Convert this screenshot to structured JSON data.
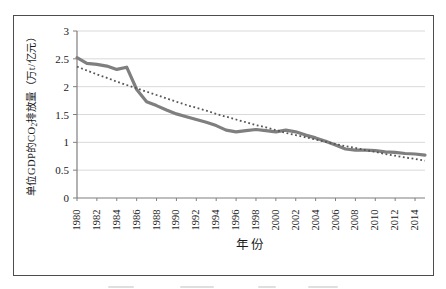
{
  "figure": {
    "ylabel_pre": "单位GDP的CO",
    "ylabel_sub": "2",
    "ylabel_post": "排放量（万t/亿元）",
    "x_axis_title": "年份"
  },
  "chart_data": {
    "type": "line",
    "title": "",
    "xlabel": "年份",
    "ylabel": "单位GDP的CO₂排放量（万t/亿元）",
    "ylim": [
      0,
      3
    ],
    "ytick_step": 0.5,
    "ytick_labels": [
      "3",
      "2.5",
      "2",
      "1.5",
      "1",
      "0.5",
      "0"
    ],
    "grid": "horizontal",
    "legend": "none",
    "x": [
      1980,
      1981,
      1982,
      1983,
      1984,
      1985,
      1986,
      1987,
      1988,
      1989,
      1990,
      1991,
      1992,
      1993,
      1994,
      1995,
      1996,
      1997,
      1998,
      1999,
      2000,
      2001,
      2002,
      2003,
      2004,
      2005,
      2006,
      2007,
      2008,
      2009,
      2010,
      2011,
      2012,
      2013,
      2014,
      2015
    ],
    "xtick_labels": [
      "1980",
      "1982",
      "1984",
      "1986",
      "1988",
      "1990",
      "1992",
      "1994",
      "1996",
      "1998",
      "2000",
      "2002",
      "2004",
      "2006",
      "2008",
      "2010",
      "2012",
      "2014"
    ],
    "series": [
      {
        "name": "solid-line",
        "style": "solid",
        "color": "#7f7f7f",
        "values": [
          2.52,
          2.42,
          2.4,
          2.37,
          2.31,
          2.35,
          1.95,
          1.73,
          1.66,
          1.58,
          1.51,
          1.46,
          1.41,
          1.36,
          1.3,
          1.22,
          1.19,
          1.21,
          1.23,
          1.21,
          1.19,
          1.22,
          1.19,
          1.13,
          1.08,
          1.02,
          0.95,
          0.88,
          0.86,
          0.86,
          0.85,
          0.83,
          0.82,
          0.8,
          0.79,
          0.77
        ]
      },
      {
        "name": "dotted-trendline",
        "style": "dotted",
        "color": "#565656",
        "values": [
          2.36,
          2.29,
          2.22,
          2.16,
          2.09,
          2.03,
          1.97,
          1.91,
          1.85,
          1.79,
          1.73,
          1.67,
          1.62,
          1.57,
          1.51,
          1.46,
          1.41,
          1.36,
          1.31,
          1.27,
          1.22,
          1.17,
          1.13,
          1.09,
          1.05,
          1.01,
          0.97,
          0.93,
          0.9,
          0.86,
          0.83,
          0.79,
          0.76,
          0.73,
          0.7,
          0.67
        ]
      }
    ],
    "colors": {
      "gridline": "#d9d9d9",
      "axis": "#7f7f7f",
      "frame_border": "#4d4d4d",
      "text": "#1a1a1a"
    }
  }
}
